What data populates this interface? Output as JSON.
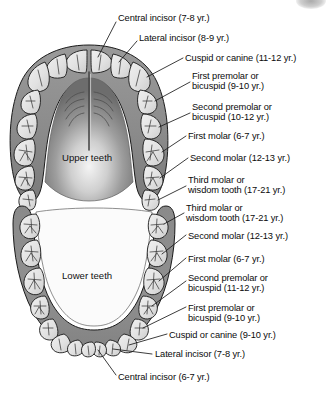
{
  "figure": {
    "arches": [
      {
        "id": "upper",
        "name": "Upper teeth"
      },
      {
        "id": "lower",
        "name": "Lower teeth"
      }
    ]
  },
  "colors": {
    "gum": "#8e8e8e",
    "gum_dark": "#6f6f6f",
    "palate": "#9b9b9b",
    "palate_deep": "#6a6a6a",
    "tooth": "#e2e2e2",
    "tooth_shadow": "#c3c3c3",
    "outline": "#1a1a1a",
    "text": "#0b0b0b",
    "leader": "#1a1a1a",
    "page": "#ffffff",
    "corner_mark": "#9a9a9a"
  },
  "upper_labels": [
    {
      "key": "u-central-incisor",
      "text": "Central incisor (7-8 yr.)",
      "lines": [
        "Central incisor (7-8 yr.)"
      ]
    },
    {
      "key": "u-lateral-incisor",
      "text": "Lateral incisor (8-9 yr.)",
      "lines": [
        "Lateral incisor (8-9 yr.)"
      ]
    },
    {
      "key": "u-cuspid",
      "text": "Cuspid or canine (11-12 yr.)",
      "lines": [
        "Cuspid or canine (11-12 yr.)"
      ]
    },
    {
      "key": "u-first-premolar",
      "text": "First premolar or bicuspid (9-10 yr.)",
      "lines": [
        "First premolar or",
        "bicuspid (9-10 yr.)"
      ]
    },
    {
      "key": "u-second-premolar",
      "text": "Second premolar or bicuspid (10-12 yr.)",
      "lines": [
        "Second premolar or",
        "bicuspid (10-12 yr.)"
      ]
    },
    {
      "key": "u-first-molar",
      "text": "First molar (6-7 yr.)",
      "lines": [
        "First molar (6-7 yr.)"
      ]
    },
    {
      "key": "u-second-molar",
      "text": "Second molar (12-13 yr.)",
      "lines": [
        "Second molar (12-13 yr.)"
      ]
    },
    {
      "key": "u-third-molar",
      "text": "Third molar or wisdom tooth (17-21 yr.)",
      "lines": [
        "Third molar or",
        "wisdom tooth (17-21 yr.)"
      ]
    }
  ],
  "lower_labels": [
    {
      "key": "l-third-molar",
      "text": "Third molar or wisdom tooth (17-21 yr.)",
      "lines": [
        "Third molar or",
        "wisdom tooth (17-21 yr.)"
      ]
    },
    {
      "key": "l-second-molar",
      "text": "Second molar (12-13 yr.)",
      "lines": [
        "Second molar (12-13 yr.)"
      ]
    },
    {
      "key": "l-first-molar",
      "text": "First molar (6-7 yr.)",
      "lines": [
        "First molar (6-7 yr.)"
      ]
    },
    {
      "key": "l-second-premolar",
      "text": "Second premolar or bicuspid (11-12 yr.)",
      "lines": [
        "Second premolar or",
        "bicuspid (11-12 yr.)"
      ]
    },
    {
      "key": "l-first-premolar",
      "text": "First premolar or bicuspid (9-10 yr.)",
      "lines": [
        "First premolar or",
        "bicuspid (9-10 yr.)"
      ]
    },
    {
      "key": "l-cuspid",
      "text": "Cuspid or canine (9-10 yr.)",
      "lines": [
        "Cuspid or canine (9-10 yr.)"
      ]
    },
    {
      "key": "l-lateral-incisor",
      "text": "Lateral incisor (7-8 yr.)",
      "lines": [
        "Lateral incisor (7-8 yr.)"
      ]
    },
    {
      "key": "l-central-incisor",
      "text": "Central incisor (6-7 yr.)",
      "lines": [
        "Central incisor (6-7 yr.)"
      ]
    }
  ],
  "label_text": {
    "u0l0": "Central incisor (7-8 yr.)",
    "u1l0": "Lateral incisor (8-9 yr.)",
    "u2l0": "Cuspid or canine (11-12 yr.)",
    "u3l0": "First premolar or",
    "u3l1": "bicuspid (9-10 yr.)",
    "u4l0": "Second premolar or",
    "u4l1": "bicuspid (10-12 yr.)",
    "u5l0": "First molar (6-7 yr.)",
    "u6l0": "Second molar (12-13 yr.)",
    "u7l0": "Third molar or",
    "u7l1": "wisdom tooth (17-21 yr.)",
    "l0l0": "Third molar or",
    "l0l1": "wisdom tooth (17-21 yr.)",
    "l1l0": "Second molar (12-13 yr.)",
    "l2l0": "First molar (6-7 yr.)",
    "l3l0": "Second premolar or",
    "l3l1": "bicuspid (11-12 yr.)",
    "l4l0": "First premolar or",
    "l4l1": "bicuspid (9-10 yr.)",
    "l5l0": "Cuspid or canine (9-10 yr.)",
    "l6l0": "Lateral incisor (7-8 yr.)",
    "l7l0": "Central incisor (6-7 yr.)",
    "upper_arch": "Upper teeth",
    "lower_arch": "Lower teeth"
  }
}
